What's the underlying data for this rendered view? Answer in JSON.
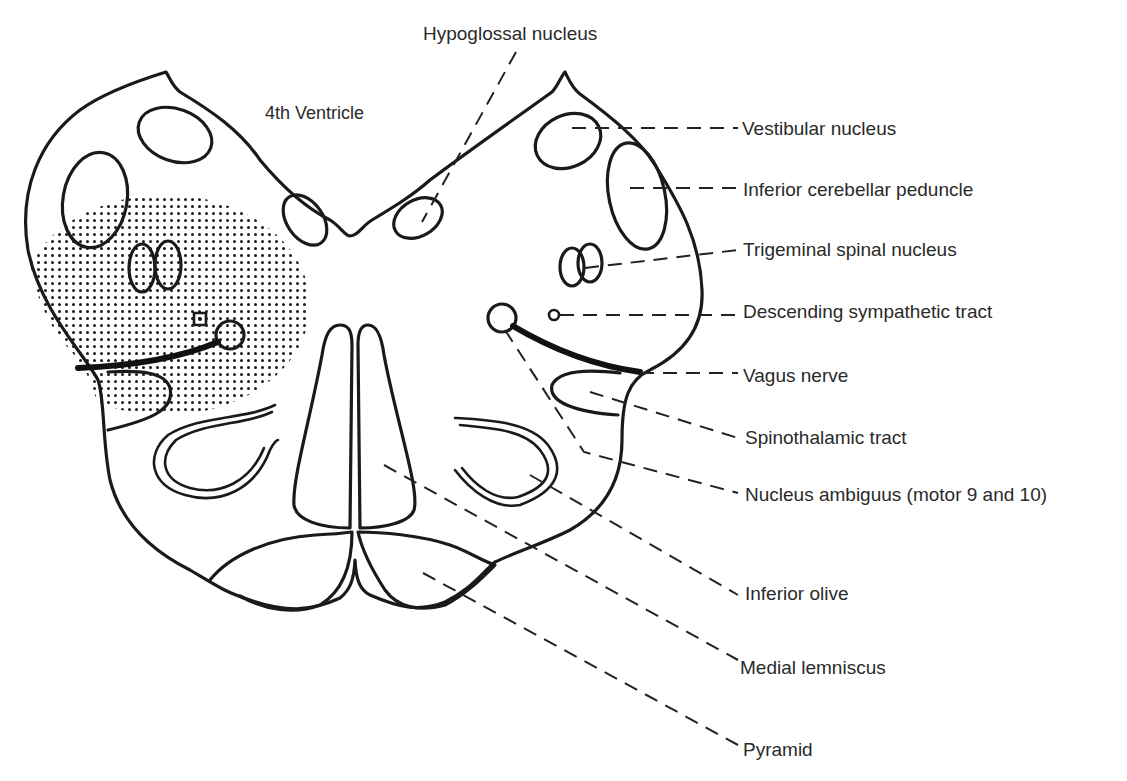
{
  "figure": {
    "colors": {
      "ink": "#1a1a1a",
      "text": "#2a2a2a",
      "background": "#ffffff",
      "stipple": "#1a1a1a"
    },
    "labels": {
      "fourth_ventricle": "4th Ventricle",
      "hypoglossal": "Hypoglossal nucleus",
      "vestibular": "Vestibular nucleus",
      "icp": "Inferior cerebellar peduncle",
      "trigeminal": "Trigeminal spinal nucleus",
      "sympathetic": "Descending sympathetic tract",
      "vagus": "Vagus nerve",
      "spinothalamic": "Spinothalamic tract",
      "ambiguus": "Nucleus ambiguus (motor 9 and 10)",
      "olive": "Inferior olive",
      "lemniscus": "Medial lemniscus",
      "pyramid": "Pyramid"
    },
    "shaded_region": "stippled lesion area (left dorsolateral medulla)"
  }
}
